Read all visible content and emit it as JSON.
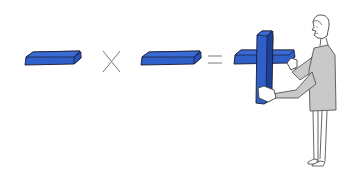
{
  "illustration": {
    "description": "Plank multiplied by plank equals a cross held by a person",
    "operators": {
      "multiply": "×",
      "equals": "="
    },
    "elements": [
      {
        "name": "left-plank",
        "kind": "horizontal-block"
      },
      {
        "name": "multiply-sign",
        "kind": "operator"
      },
      {
        "name": "right-plank",
        "kind": "horizontal-block"
      },
      {
        "name": "equals-sign",
        "kind": "operator"
      },
      {
        "name": "cross-result",
        "kind": "crossed-blocks"
      },
      {
        "name": "person",
        "kind": "figure-holding-cross"
      }
    ]
  },
  "colors": {
    "block_blue": "#2f5fc8",
    "block_top": "#3a6ad4",
    "block_dark": "#1d3f94",
    "outline": "#1a1a2a",
    "operator_gray": "#7a7a7a",
    "shirt_gray": "#c9c9c9",
    "line_gray": "#555555",
    "background": "#ffffff"
  }
}
